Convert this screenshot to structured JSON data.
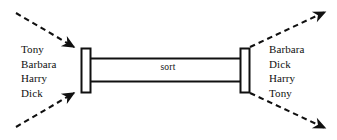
{
  "diagram": {
    "process": {
      "label": "sort",
      "shape": "pipe"
    },
    "input": {
      "side": "left",
      "names": [
        "Tony",
        "Barbara",
        "Harry",
        "Dick"
      ]
    },
    "output": {
      "side": "right",
      "names": [
        "Barbara",
        "Dick",
        "Harry",
        "Tony"
      ]
    },
    "connectors": {
      "input_top": "dashed-arrow-in",
      "input_bottom": "dashed-arrow-in",
      "output_top": "dashed-arrow-out",
      "output_bottom": "dashed-arrow-out"
    },
    "colors": {
      "background": "#ffffff",
      "stroke": "#101010",
      "text": "#101010"
    }
  }
}
